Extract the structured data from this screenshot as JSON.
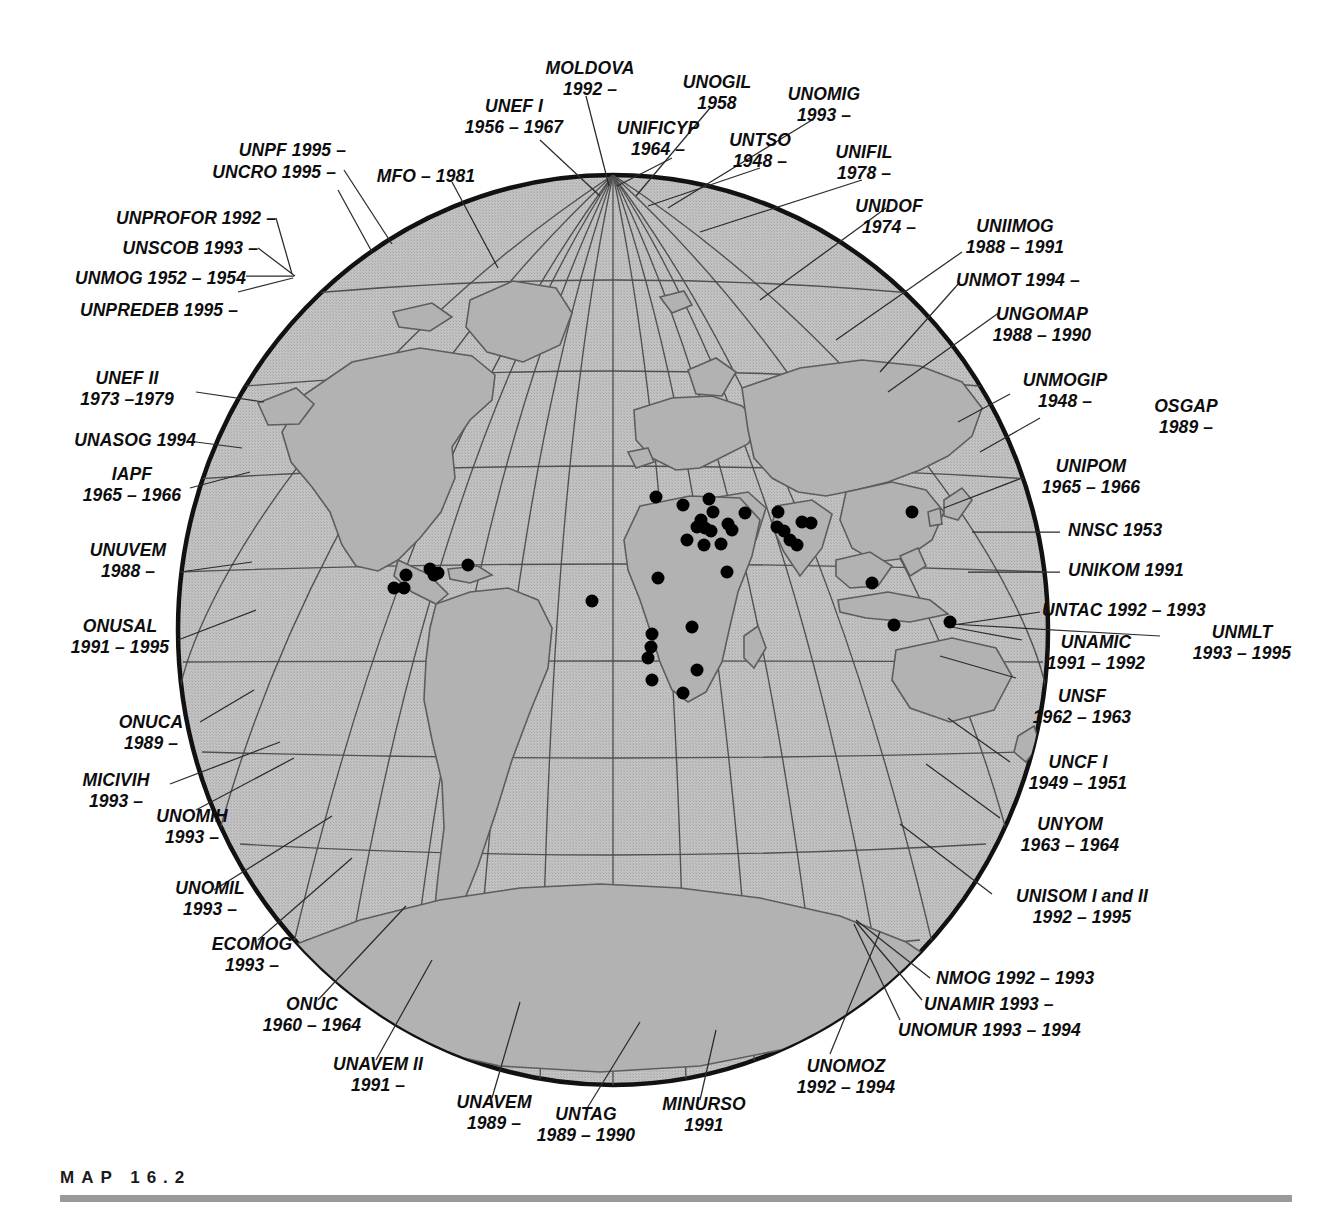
{
  "figure": {
    "caption_label": "MAP  16.2",
    "projection": "globe-orthographic-style world map with graticule",
    "colors": {
      "land_fill": "#b9b9b9",
      "ocean_fill": "#bdbdbd",
      "globe_outline": "#121212",
      "graticule": "#4a4a4a",
      "leader_line": "#2a2a2a",
      "site_dot": "#000000",
      "caption_rule": "#9a9a9a",
      "background": "#ffffff",
      "text": "#0d0d0d"
    }
  },
  "labels": [
    {
      "id": "unpf",
      "lines": [
        "UNPF 1995 –"
      ]
    },
    {
      "id": "uncro",
      "lines": [
        "UNCRO 1995 –"
      ]
    },
    {
      "id": "unprofor",
      "lines": [
        "UNPROFOR 1992 –"
      ]
    },
    {
      "id": "unscob",
      "lines": [
        "UNSCOB 1993 –"
      ]
    },
    {
      "id": "unmog",
      "lines": [
        "UNMOG 1952 – 1954"
      ]
    },
    {
      "id": "unpredeb",
      "lines": [
        "UNPREDEB 1995 –"
      ]
    },
    {
      "id": "mfo",
      "lines": [
        "MFO – 1981"
      ]
    },
    {
      "id": "unef1",
      "lines": [
        "UNEF I",
        "1956 – 1967"
      ]
    },
    {
      "id": "moldova",
      "lines": [
        "MOLDOVA",
        "1992 –"
      ]
    },
    {
      "id": "unificyp",
      "lines": [
        "UNIFICYP",
        "1964 –"
      ]
    },
    {
      "id": "unogil",
      "lines": [
        "UNOGIL",
        "1958"
      ]
    },
    {
      "id": "untso",
      "lines": [
        "UNTSO",
        "1948 –"
      ]
    },
    {
      "id": "unomig",
      "lines": [
        "UNOMIG",
        "1993 –"
      ]
    },
    {
      "id": "unifil",
      "lines": [
        "UNIFIL",
        "1978 –"
      ]
    },
    {
      "id": "unidof",
      "lines": [
        "UNIDOF",
        "1974 –"
      ]
    },
    {
      "id": "uniimog",
      "lines": [
        "UNIIMOG",
        "1988 – 1991"
      ]
    },
    {
      "id": "unmot",
      "lines": [
        "UNMOT 1994 –"
      ]
    },
    {
      "id": "ungomap",
      "lines": [
        "UNGOMAP",
        "1988 – 1990"
      ]
    },
    {
      "id": "unmogip",
      "lines": [
        "UNMOGIP",
        "1948 –"
      ]
    },
    {
      "id": "osgap",
      "lines": [
        "OSGAP",
        "1989 –"
      ]
    },
    {
      "id": "unipom",
      "lines": [
        "UNIPOM",
        "1965 – 1966"
      ]
    },
    {
      "id": "nnsc",
      "lines": [
        "NNSC 1953"
      ]
    },
    {
      "id": "unikom",
      "lines": [
        "UNIKOM 1991"
      ]
    },
    {
      "id": "untac",
      "lines": [
        "UNTAC 1992 – 1993"
      ]
    },
    {
      "id": "unmlt",
      "lines": [
        "UNMLT",
        "1993 – 1995"
      ]
    },
    {
      "id": "unamic",
      "lines": [
        "UNAMIC",
        "1991 – 1992"
      ]
    },
    {
      "id": "unsf",
      "lines": [
        "UNSF",
        "1962 – 1963"
      ]
    },
    {
      "id": "uncf1",
      "lines": [
        "UNCF  I",
        "1949 – 1951"
      ]
    },
    {
      "id": "unyom",
      "lines": [
        "UNYOM",
        "1963 – 1964"
      ]
    },
    {
      "id": "unisom",
      "lines": [
        "UNISOM I and II",
        "1992 – 1995"
      ]
    },
    {
      "id": "nmog",
      "lines": [
        "NMOG 1992 – 1993"
      ]
    },
    {
      "id": "unamir",
      "lines": [
        "UNAMIR 1993 –"
      ]
    },
    {
      "id": "unomur",
      "lines": [
        "UNOMUR 1993 – 1994"
      ]
    },
    {
      "id": "unomoz",
      "lines": [
        "UNOMOZ",
        "1992 – 1994"
      ]
    },
    {
      "id": "minurso",
      "lines": [
        "MINURSO",
        "1991"
      ]
    },
    {
      "id": "untag",
      "lines": [
        "UNTAG",
        "1989 – 1990"
      ]
    },
    {
      "id": "unavem",
      "lines": [
        "UNAVEM",
        "1989 –"
      ]
    },
    {
      "id": "unavem2",
      "lines": [
        "UNAVEM II",
        "1991 –"
      ]
    },
    {
      "id": "onuc",
      "lines": [
        "ONUC",
        "1960 – 1964"
      ]
    },
    {
      "id": "ecomog",
      "lines": [
        "ECOMOG",
        "1993 –"
      ]
    },
    {
      "id": "unomil",
      "lines": [
        "UNOMIL",
        "1993 –"
      ]
    },
    {
      "id": "unomih",
      "lines": [
        "UNOMIH",
        "1993 –"
      ]
    },
    {
      "id": "micivih",
      "lines": [
        "MICIVIH",
        "1993 –"
      ]
    },
    {
      "id": "onuca",
      "lines": [
        "ONUCA",
        "1989 –"
      ]
    },
    {
      "id": "onusal",
      "lines": [
        "ONUSAL",
        "1991 – 1995"
      ]
    },
    {
      "id": "unuvem",
      "lines": [
        "UNUVEM",
        "1988 –"
      ]
    },
    {
      "id": "iapf",
      "lines": [
        "IAPF",
        "1965 – 1966"
      ]
    },
    {
      "id": "unasog",
      "lines": [
        "UNASOG 1994"
      ]
    },
    {
      "id": "unef2",
      "lines": [
        "UNEF II",
        "1973 –1979"
      ]
    }
  ]
}
